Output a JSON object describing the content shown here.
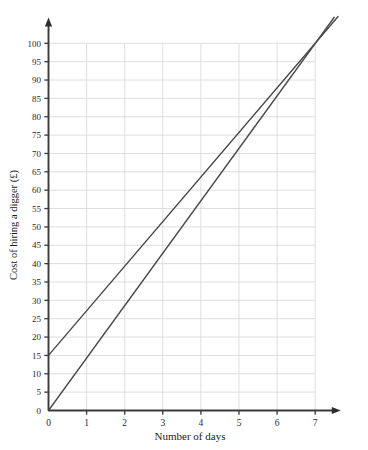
{
  "chart_data": {
    "type": "line",
    "title": "",
    "xlabel": "Number of days",
    "ylabel": "Cost of hiring a digger (£)",
    "xlim": [
      0,
      7.6
    ],
    "ylim": [
      0,
      107
    ],
    "grid": true,
    "legend_position": "none",
    "x_ticks": [
      0,
      1,
      2,
      3,
      4,
      5,
      6,
      7
    ],
    "x_tick_labels": [
      "0",
      "1",
      "2",
      "3",
      "4",
      "5",
      "6",
      "7"
    ],
    "y_ticks": [
      0,
      5,
      10,
      15,
      20,
      25,
      30,
      35,
      40,
      45,
      50,
      55,
      60,
      65,
      70,
      75,
      80,
      85,
      90,
      95,
      100
    ],
    "y_tick_labels": [
      "0",
      "5",
      "10",
      "15",
      "20",
      "25",
      "30",
      "35",
      "40",
      "45",
      "50",
      "55",
      "60",
      "65",
      "70",
      "75",
      "80",
      "85",
      "90",
      "95",
      "100"
    ],
    "gridlines_x": [
      1,
      2,
      3,
      4,
      5,
      6,
      7
    ],
    "gridlines_y": [
      5,
      10,
      15,
      20,
      25,
      30,
      35,
      40,
      45,
      50,
      55,
      60,
      65,
      70,
      75,
      80,
      85,
      90,
      95,
      100
    ],
    "series": [
      {
        "name": "line-with-intercept",
        "intercept": 15,
        "slope": 12.143,
        "x": [
          0,
          7.6
        ],
        "values": [
          15,
          107.3
        ],
        "color": "#454545"
      },
      {
        "name": "line-through-origin",
        "intercept": 0,
        "slope": 14.286,
        "x": [
          0,
          7.5
        ],
        "values": [
          0,
          107.1
        ],
        "color": "#4a4a4a"
      }
    ],
    "colors": {
      "axis": "#3a3a3a",
      "grid": "#d8d8d8",
      "series_a": "#454545",
      "series_b": "#4a4a4a",
      "background": "#ffffff",
      "text": "#1b1b1b"
    }
  }
}
